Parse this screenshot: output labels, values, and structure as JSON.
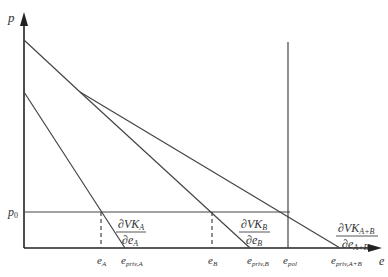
{
  "diagram": {
    "type": "economics marginal abatement / valuation curves",
    "axes": {
      "y_label": "p",
      "x_label": "e",
      "price_level_label_main": "p",
      "price_level_label_sub": "0"
    },
    "x_ticks": [
      {
        "main": "e",
        "sub": "A"
      },
      {
        "main": "e",
        "sub": "priv,A"
      },
      {
        "main": "e",
        "sub": "B"
      },
      {
        "main": "e",
        "sub": "priv,B"
      },
      {
        "main": "e",
        "sub": "pol"
      },
      {
        "main": "e",
        "sub": "priv,A+B"
      }
    ],
    "curves": [
      {
        "id": "A",
        "num_main": "∂VK",
        "num_sub": "A",
        "den_main": "∂e",
        "den_sub": "A"
      },
      {
        "id": "B",
        "num_main": "∂VK",
        "num_sub": "B",
        "den_main": "∂e",
        "den_sub": "B"
      },
      {
        "id": "A+B",
        "num_main": "∂VK",
        "num_sub": "A+B",
        "den_main": "∂e",
        "den_sub": "A+B"
      }
    ]
  }
}
